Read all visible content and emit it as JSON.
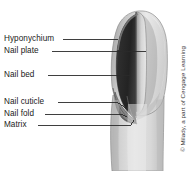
{
  "figure": {
    "background_color": "#ffffff",
    "credit": "© Milady, a part of Cengage Learning",
    "labels": [
      {
        "id": "hyponychium",
        "text": "Hyponychium",
        "x": 4,
        "y": 34,
        "leader_y": 39,
        "leader_x1": 63,
        "leader_x2": 118
      },
      {
        "id": "nail-plate",
        "text": "Nail plate",
        "x": 4,
        "y": 46,
        "leader_y": 51,
        "leader_x1": 52,
        "leader_x2": 146
      },
      {
        "id": "nail-bed",
        "text": "Nail bed",
        "x": 4,
        "y": 70,
        "leader_y": 75,
        "leader_x1": 48,
        "leader_x2": 130
      },
      {
        "id": "nail-cuticle",
        "text": "Nail cuticle",
        "x": 4,
        "y": 97,
        "leader_y": 102,
        "leader_x1": 58,
        "leader_x2": 128
      },
      {
        "id": "nail-fold",
        "text": "Nail fold",
        "x": 4,
        "y": 109,
        "leader_y": 114,
        "leader_x1": 45,
        "leader_x2": 127
      },
      {
        "id": "matrix",
        "text": "Matrix",
        "x": 4,
        "y": 120,
        "leader_y": 125,
        "leader_x1": 38,
        "leader_x2": 131
      }
    ],
    "colors": {
      "skin_light": "#e6e6e6",
      "skin_mid": "#c9c9c9",
      "skin_dark": "#a8a8a8",
      "nail_plate": "#2b2b2b",
      "nail_bed": "#4a4a4a",
      "outline": "#5a5a5a",
      "leader_line": "#2a2a2a",
      "text": "#1a1a1a"
    }
  }
}
